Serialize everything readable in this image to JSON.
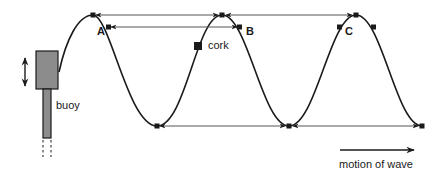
{
  "diagram": {
    "type": "transverse-wave-illustration",
    "labels": {
      "buoy": "buoy",
      "cork": "cork",
      "point_a": "A",
      "point_b": "B",
      "point_c": "C",
      "motion": "motion of wave"
    },
    "colors": {
      "line": "#1a1a1a",
      "buoy_fill": "#8c8c8c",
      "guide_line": "#555555",
      "background": "#ffffff"
    },
    "wave": {
      "crests_x": [
        93,
        222,
        356
      ],
      "troughs_x": [
        157,
        289,
        422
      ],
      "crest_y": 15,
      "trough_y": 126
    },
    "guides": [
      {
        "name": "crest-to-crest",
        "from": "crest 1",
        "to": "crest 3",
        "y": 15
      },
      {
        "name": "A-to-B",
        "from": "A",
        "to": "B",
        "y": 27
      },
      {
        "name": "trough-to-trough",
        "from": "trough 1",
        "to": "trough 3",
        "y": 126
      }
    ]
  }
}
